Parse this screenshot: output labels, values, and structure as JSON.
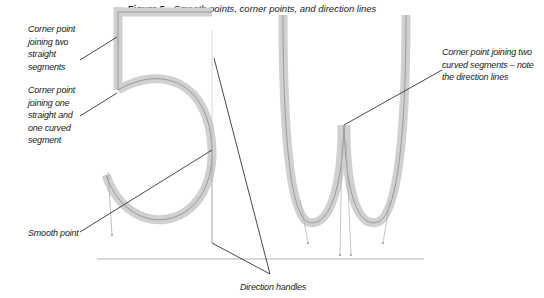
{
  "caption": {
    "figure_label": "Figure 5",
    "title": "Smooth points, corner points, and direction lines"
  },
  "glyphs": [
    "5",
    "W"
  ],
  "labels": {
    "corner_straight": "Corner point joining two straight segments",
    "corner_mixed": "Corner point joining one straight and one curved segment",
    "smooth": "Smooth point",
    "corner_curved": "Corner point joining two curved segments – note the direction lines",
    "handles": "Direction handles"
  },
  "colors": {
    "stroke_fill": "#cfcfcf",
    "path_line": "#8a8a8a",
    "leader": "#333333",
    "baseline": "#aaaaaa"
  }
}
